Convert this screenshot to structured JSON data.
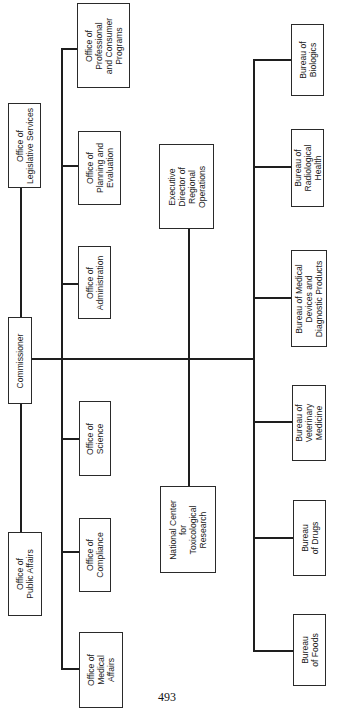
{
  "chart": {
    "orientation": "rotated 90 degrees counter-clockwise",
    "root": {
      "id": "commissioner",
      "label": "Commissioner"
    },
    "staff_offices": [
      {
        "id": "legislative",
        "label": "Office of\nLegislative Services"
      },
      {
        "id": "public-affairs",
        "label": "Office of\nPublic Affairs"
      }
    ],
    "offices": [
      {
        "id": "professional-consumer",
        "label": "Office of\nProfessional\nand Consumer\nPrograms"
      },
      {
        "id": "planning",
        "label": "Office of\nPlanning and\nEvaluation"
      },
      {
        "id": "administration",
        "label": "Office of\nAdministration"
      },
      {
        "id": "science",
        "label": "Office of\nScience"
      },
      {
        "id": "compliance",
        "label": "Office of\nCompliance"
      },
      {
        "id": "medical-affairs",
        "label": "Office of\nMedical\nAffairs"
      }
    ],
    "field": [
      {
        "id": "regional-ops",
        "label": "Executive\nDirector of\nRegional\nOperations"
      },
      {
        "id": "nctr",
        "label": "National Center\nfor\nToxicological\nResearch"
      }
    ],
    "bureaus": [
      {
        "id": "biologics",
        "label": "Bureau of\nBiologics"
      },
      {
        "id": "radiological",
        "label": "Bureau of\nRadiological\nHealth"
      },
      {
        "id": "devices",
        "label": "Bureau of Medical\nDevices and\nDiagnostic Products"
      },
      {
        "id": "veterinary",
        "label": "Bureau of\nVeterinary\nMedicine"
      },
      {
        "id": "drugs",
        "label": "Bureau\nof Drugs"
      },
      {
        "id": "foods",
        "label": "Bureau\nof Foods"
      }
    ]
  },
  "page": {
    "number": "493"
  },
  "colors": {
    "line": "#1e1e1e",
    "background": "#ffffff",
    "text": "#222222"
  }
}
